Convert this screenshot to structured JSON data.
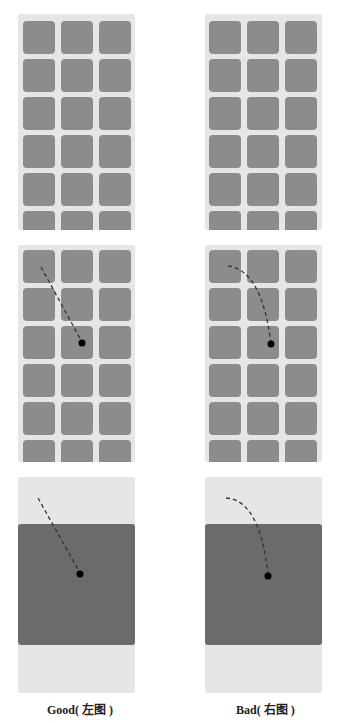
{
  "colors": {
    "page_bg": "#ffffff",
    "panel_bg": "#e6e6e6",
    "tile": "#8c8c8c",
    "expanded_tile": "#6b6b6b",
    "trail": "#333333",
    "dot": "#000000"
  },
  "grid": {
    "columns": 3,
    "rows_visible": 6
  },
  "rows": [
    {
      "name": "grid-row",
      "description": "static grid"
    },
    {
      "name": "touch-row",
      "description": "grid with touch trail"
    },
    {
      "name": "expanded-row",
      "description": "expanded tile with touch trail"
    }
  ],
  "columns": [
    {
      "key": "good",
      "trail_type": "straight"
    },
    {
      "key": "bad",
      "trail_type": "curved"
    }
  ],
  "captions": {
    "good": "Good( 左图 )",
    "bad": "Bad( 右图 )"
  }
}
